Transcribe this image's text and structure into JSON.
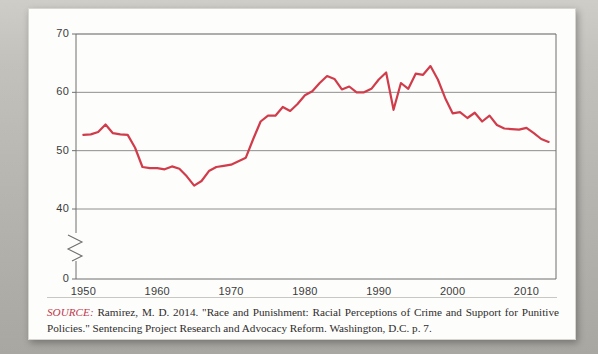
{
  "figure": {
    "caption": {
      "source_label": "SOURCE:",
      "text": " Ramirez, M. D. 2014. \"Race and Punishment: Racial Perceptions of Crime and Support for Punitive Policies.\" Sentencing Project Research and Advocacy Reform. Washington, D.C. p. 7."
    }
  },
  "chart_data": {
    "type": "line",
    "title": "",
    "subtitle": "",
    "xlabel": "",
    "ylabel": "",
    "xlim": [
      1949,
      2014
    ],
    "ylim": [
      0,
      70
    ],
    "axis_break": true,
    "axis_break_between": [
      0,
      40
    ],
    "grid": true,
    "grid_axis": "y",
    "legend": "none",
    "line_color": "#d13c4b",
    "ytick_labels": [
      "0",
      "40",
      "50",
      "60",
      "70"
    ],
    "ytick_values": [
      0,
      40,
      50,
      60,
      70
    ],
    "xtick_labels": [
      "1950",
      "1960",
      "1970",
      "1980",
      "1990",
      "2000",
      "2010"
    ],
    "xtick_values": [
      1950,
      1960,
      1970,
      1980,
      1990,
      2000,
      2010
    ],
    "series": [
      {
        "name": "Support for punitive policies",
        "color": "#d13c4b",
        "x": [
          1950,
          1951,
          1952,
          1953,
          1954,
          1955,
          1956,
          1957,
          1958,
          1959,
          1960,
          1961,
          1962,
          1963,
          1964,
          1965,
          1966,
          1967,
          1968,
          1969,
          1970,
          1971,
          1972,
          1973,
          1974,
          1975,
          1976,
          1977,
          1978,
          1979,
          1980,
          1981,
          1982,
          1983,
          1984,
          1985,
          1986,
          1987,
          1988,
          1989,
          1990,
          1991,
          1992,
          1993,
          1994,
          1995,
          1996,
          1997,
          1998,
          1999,
          2000,
          2001,
          2002,
          2003,
          2004,
          2005,
          2006,
          2007,
          2008,
          2009,
          2010,
          2011,
          2012,
          2013
        ],
        "y": [
          52.7,
          52.8,
          53.2,
          54.5,
          53.0,
          52.8,
          52.7,
          50.5,
          47.2,
          47.0,
          47.0,
          46.8,
          47.3,
          46.9,
          45.6,
          44.0,
          44.8,
          46.5,
          47.2,
          47.4,
          47.6,
          48.2,
          48.8,
          52.0,
          55.0,
          56.0,
          56.0,
          57.5,
          56.8,
          58.0,
          59.5,
          60.2,
          61.6,
          62.8,
          62.3,
          60.5,
          61.0,
          60.0,
          60.0,
          60.6,
          62.2,
          63.4,
          57.0,
          61.6,
          60.6,
          63.2,
          63.0,
          64.5,
          62.2,
          59.0,
          56.4,
          56.6,
          55.6,
          56.5,
          55.0,
          56.0,
          54.4,
          53.8,
          53.7,
          53.6,
          53.9,
          53.0,
          52.0,
          51.5
        ]
      }
    ]
  }
}
